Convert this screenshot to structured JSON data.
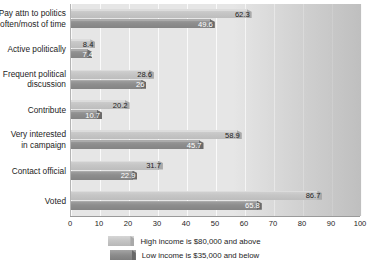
{
  "chart_data": {
    "type": "bar",
    "orientation": "horizontal",
    "title": "",
    "subtitle": "",
    "xlabel": "",
    "ylabel": "",
    "xlim": [
      0,
      100
    ],
    "xticks": [
      "0",
      "10",
      "20",
      "30",
      "40",
      "50",
      "60",
      "70",
      "80",
      "90",
      "100"
    ],
    "grid": true,
    "legend_position": "bottom-center",
    "categories": [
      "Pay attn to politics\noften/most of time",
      "Active politically",
      "Frequent political\ndiscussion",
      "Contribute",
      "Very interested\nin campaign",
      "Contact official",
      "Voted"
    ],
    "series": [
      {
        "name": "High income is $80,000 and above",
        "color": "#c6c6c6",
        "values": [
          62.3,
          8.4,
          28.6,
          20.2,
          58.9,
          31.7,
          86.7
        ],
        "labels": [
          "62.3",
          "8.4",
          "28.6",
          "20.2",
          "58.9",
          "31.7",
          "86.7"
        ]
      },
      {
        "name": "Low income is $35,000 and below",
        "color": "#8e8e8e",
        "values": [
          49.6,
          7.4,
          26,
          10.7,
          45.7,
          22.9,
          65.8
        ],
        "labels": [
          "49.6",
          "7.4",
          "26",
          "10.7",
          "45.7",
          "22.9",
          "65.8"
        ]
      }
    ]
  },
  "legend": {
    "items": [
      {
        "label": "High income is $80,000 and above",
        "key": "high"
      },
      {
        "label": "Low income is $35,000 and below",
        "key": "low"
      }
    ]
  },
  "colors": {
    "plot_background": "#e6e6e6",
    "gridline": "#fafafa",
    "axis_line": "#9a9a9a",
    "high_series": "#c6c6c6",
    "low_series": "#8e8e8e",
    "text": "#1c1c1c",
    "label_on_dark": "#ffffff"
  }
}
